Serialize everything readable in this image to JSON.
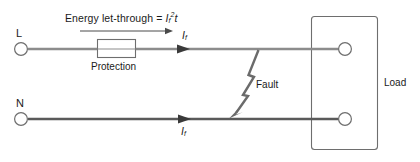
{
  "diagram": {
    "type": "electrical-circuit-fault-schematic",
    "colors": {
      "line_live": "#8c8c8c",
      "line_neutral": "#5a5a5a",
      "outline": "#6e6e6e",
      "fault": "#6b6b6b",
      "text": "#1a1a1a",
      "background": "#ffffff"
    },
    "formula": {
      "prefix": "Energy let-through",
      "equals": "=",
      "current_symbol": "I",
      "current_subscript": "f",
      "exponent": "2",
      "time_symbol": "t",
      "full_text": "Energy let-through = If2t"
    },
    "terminals": {
      "live_label": "L",
      "neutral_label": "N"
    },
    "components": {
      "protection_label": "Protection",
      "load_label": "Load",
      "fault_label": "Fault"
    },
    "currents": {
      "live_symbol": "I",
      "live_subscript": "f",
      "neutral_symbol": "I",
      "neutral_subscript": "f"
    }
  }
}
